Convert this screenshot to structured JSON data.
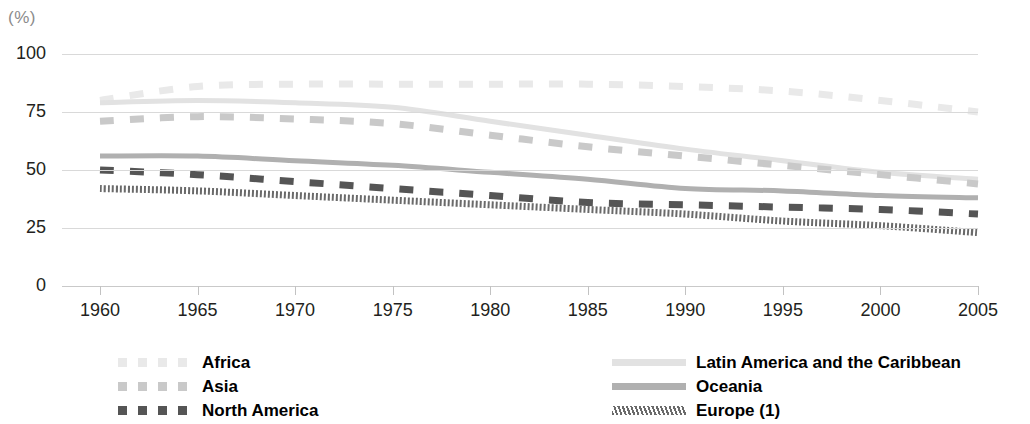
{
  "unit_label": "(%)",
  "chart_data": {
    "type": "line",
    "title": "",
    "xlabel": "",
    "ylabel": "(%)",
    "ylim": [
      0,
      100
    ],
    "xlim": [
      1960,
      2005
    ],
    "yticks": [
      0,
      25,
      50,
      75,
      100
    ],
    "xticks": [
      1960,
      1965,
      1970,
      1975,
      1980,
      1985,
      1990,
      1995,
      2000,
      2005
    ],
    "grid": true,
    "legend_position": "bottom",
    "x": [
      1960,
      1965,
      1970,
      1975,
      1980,
      1985,
      1990,
      1995,
      2000,
      2005
    ],
    "series": [
      {
        "name": "Africa",
        "style": "dashed",
        "color": "#e9e9e9",
        "values": [
          80,
          86,
          87,
          87,
          87,
          87,
          86,
          84,
          80,
          75
        ]
      },
      {
        "name": "Latin America and the Caribbean",
        "style": "solid",
        "color": "#e2e2e2",
        "values": [
          79,
          80,
          79,
          77,
          71,
          65,
          59,
          54,
          49,
          46
        ]
      },
      {
        "name": "Asia",
        "style": "dashed",
        "color": "#c9c9c9",
        "values": [
          71,
          73,
          72,
          70,
          65,
          60,
          56,
          52,
          48,
          44
        ]
      },
      {
        "name": "Oceania",
        "style": "solid",
        "color": "#b0b0b0",
        "values": [
          56,
          56,
          54,
          52,
          49,
          46,
          42,
          41,
          39,
          38
        ]
      },
      {
        "name": "North America",
        "style": "dashed",
        "color": "#555555",
        "values": [
          50,
          48,
          45,
          42,
          39,
          36,
          35,
          34,
          33,
          31
        ]
      },
      {
        "name": "Europe (1)",
        "style": "hatched",
        "color": "#6a6a6a",
        "values": [
          42,
          41,
          39,
          37,
          35,
          33,
          31,
          28,
          26,
          23
        ]
      }
    ]
  },
  "axis": {
    "y_tick_labels": [
      "100",
      "75",
      "50",
      "25",
      "0"
    ],
    "x_tick_labels": [
      "1960",
      "1965",
      "1970",
      "1975",
      "1980",
      "1985",
      "1990",
      "1995",
      "2000",
      "2005"
    ]
  },
  "legend": {
    "left_column": [
      {
        "label": "Africa",
        "swatch": "dashed-lightest"
      },
      {
        "label": "Asia",
        "swatch": "dashed-light"
      },
      {
        "label": "North America",
        "swatch": "dashed-dark"
      }
    ],
    "right_column": [
      {
        "label": "Latin America and the Caribbean",
        "swatch": "solid-lightest"
      },
      {
        "label": "Oceania",
        "swatch": "solid-medium"
      },
      {
        "label": "Europe (1)",
        "swatch": "hatched-dark"
      }
    ]
  }
}
